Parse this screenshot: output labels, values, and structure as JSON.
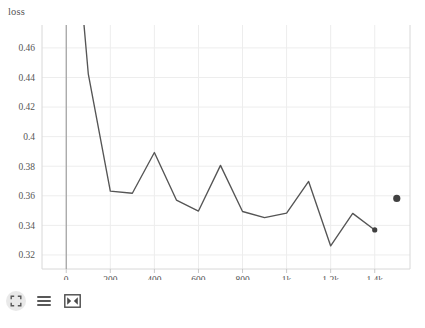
{
  "chart_data": {
    "type": "line",
    "title": "loss",
    "xlabel": "",
    "ylabel": "",
    "grid": true,
    "legend": "none",
    "xlim": [
      -110,
      1560
    ],
    "ylim": [
      0.3105,
      0.4755
    ],
    "x_ticks": [
      0,
      200,
      400,
      600,
      800,
      1000,
      1200,
      1400
    ],
    "x_tick_labels": [
      "0",
      "200",
      "400",
      "600",
      "800",
      "1k",
      "1.2k",
      "1.4k"
    ],
    "y_ticks": [
      0.32,
      0.34,
      0.36,
      0.38,
      0.4,
      0.42,
      0.44,
      0.46
    ],
    "y_tick_labels": [
      "0.32",
      "0.34",
      "0.36",
      "0.38",
      "0.4",
      "0.42",
      "0.44",
      "0.46"
    ],
    "line_color": "#555555",
    "marker_color": "#404040",
    "series": [
      {
        "name": "loss",
        "x": [
          80,
          100,
          200,
          300,
          400,
          500,
          600,
          700,
          800,
          900,
          1000,
          1100,
          1200,
          1300,
          1400
        ],
        "values": [
          0.4765,
          0.4425,
          0.3632,
          0.3617,
          0.3893,
          0.3571,
          0.3497,
          0.3806,
          0.3494,
          0.3452,
          0.3483,
          0.3697,
          0.3261,
          0.3481,
          0.3369
        ]
      }
    ],
    "markers": [
      {
        "name": "current-point",
        "x": 1400,
        "y": 0.3369,
        "radius": 2.6
      },
      {
        "name": "highlight-point",
        "x": 1500,
        "y": 0.3582,
        "radius": 3.6
      }
    ]
  },
  "toolbar": {
    "buttons": [
      {
        "name": "zoom-reset-icon",
        "label": "Reset zoom"
      },
      {
        "name": "menu-lines-icon",
        "label": "Toggle legend"
      },
      {
        "name": "fullscreen-expand-icon",
        "label": "Expand chart"
      }
    ]
  }
}
